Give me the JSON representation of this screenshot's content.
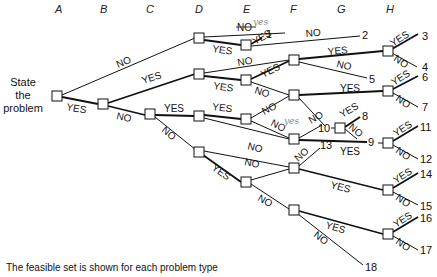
{
  "columns": [
    "A",
    "B",
    "C",
    "D",
    "E",
    "F",
    "G",
    "H"
  ],
  "start_label": [
    "State",
    "the",
    "problem"
  ],
  "labels": {
    "yes": "YES",
    "no": "NO"
  },
  "handwritten_correction": "yes",
  "outcomes": [
    "1",
    "2",
    "3",
    "4",
    "5",
    "6",
    "7",
    "8",
    "9",
    "10",
    "11",
    "12",
    "13",
    "14",
    "15",
    "16",
    "17",
    "18"
  ],
  "caption": "The feasible set is shown for each problem type"
}
